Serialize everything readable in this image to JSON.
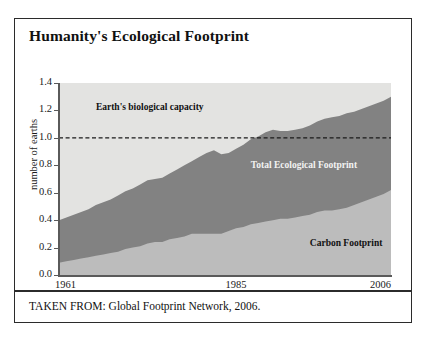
{
  "figure": {
    "title": "Humanity's Ecological Footprint",
    "source": "TAKEN FROM: Global Footprint Network, 2006."
  },
  "colors": {
    "background": "#e3e3e1",
    "capacity_area": "#e3e3e1",
    "total_footprint_band": "#828282",
    "carbon_footprint_band": "#bcbcbc",
    "axis": "#5a5a5a",
    "border": "#2b2b2b",
    "reference_line": "#1a1a1a"
  },
  "chart_data": {
    "type": "area",
    "title": "Humanity's Ecological Footprint",
    "subtitle": "",
    "xlabel": "",
    "ylabel": "number of earths",
    "xlim": [
      1961,
      2006
    ],
    "ylim": [
      0.0,
      1.4
    ],
    "grid": false,
    "legend": "inline-annotations",
    "xticks": [
      "1961",
      "1985",
      "2006"
    ],
    "xtick_values": [
      1961,
      1985,
      2006
    ],
    "yticks": [
      "0.0",
      "0.2",
      "0.4",
      "0.6",
      "0.8",
      "1.0",
      "1.2",
      "1.4"
    ],
    "ytick_values": [
      0.0,
      0.2,
      0.4,
      0.6,
      0.8,
      1.0,
      1.2,
      1.4
    ],
    "annotations": [
      {
        "text": "Earth's biological capacity",
        "x": 1966,
        "y": 1.2,
        "color": "#111111"
      },
      {
        "text": "Total Ecological Footprint",
        "x": 1987,
        "y": 0.78,
        "color": "#f2f2f2"
      },
      {
        "text": "Carbon Footprint",
        "x": 1995,
        "y": 0.21,
        "color": "#111111"
      }
    ],
    "reference_lines": [
      {
        "y": 1.0,
        "style": "dashed",
        "label": "one earth"
      }
    ],
    "x": [
      1961,
      1962,
      1963,
      1964,
      1965,
      1966,
      1967,
      1968,
      1969,
      1970,
      1971,
      1972,
      1973,
      1974,
      1975,
      1976,
      1977,
      1978,
      1979,
      1980,
      1981,
      1982,
      1983,
      1984,
      1985,
      1986,
      1987,
      1988,
      1989,
      1990,
      1991,
      1992,
      1993,
      1994,
      1995,
      1996,
      1997,
      1998,
      1999,
      2000,
      2001,
      2002,
      2003,
      2004,
      2005,
      2006
    ],
    "series": [
      {
        "name": "Total Ecological Footprint",
        "values": [
          0.4,
          0.42,
          0.44,
          0.46,
          0.48,
          0.51,
          0.53,
          0.55,
          0.58,
          0.61,
          0.63,
          0.66,
          0.69,
          0.7,
          0.71,
          0.74,
          0.77,
          0.8,
          0.83,
          0.86,
          0.89,
          0.91,
          0.88,
          0.89,
          0.92,
          0.95,
          0.99,
          1.01,
          1.04,
          1.06,
          1.05,
          1.05,
          1.06,
          1.07,
          1.09,
          1.12,
          1.14,
          1.15,
          1.16,
          1.18,
          1.19,
          1.21,
          1.23,
          1.25,
          1.27,
          1.3
        ]
      },
      {
        "name": "Carbon Footprint",
        "values": [
          0.09,
          0.1,
          0.11,
          0.12,
          0.13,
          0.14,
          0.15,
          0.16,
          0.17,
          0.19,
          0.2,
          0.21,
          0.23,
          0.24,
          0.24,
          0.26,
          0.27,
          0.28,
          0.3,
          0.3,
          0.3,
          0.3,
          0.3,
          0.32,
          0.34,
          0.35,
          0.37,
          0.38,
          0.39,
          0.4,
          0.41,
          0.41,
          0.42,
          0.43,
          0.44,
          0.46,
          0.47,
          0.47,
          0.48,
          0.49,
          0.51,
          0.53,
          0.55,
          0.57,
          0.59,
          0.62
        ]
      }
    ]
  }
}
